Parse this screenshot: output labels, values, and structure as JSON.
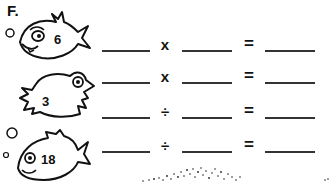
{
  "section_label": "F.",
  "fish": [
    {
      "number": "6"
    },
    {
      "number": "3"
    },
    {
      "number": "18"
    }
  ],
  "equations": [
    {
      "operator": "x",
      "equals": "="
    },
    {
      "operator": "x",
      "equals": "="
    },
    {
      "operator": "÷",
      "equals": "="
    },
    {
      "operator": "÷",
      "equals": "="
    }
  ]
}
